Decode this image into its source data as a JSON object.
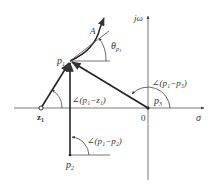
{
  "diagram": {
    "type": "root-locus-angle-condition",
    "axes": {
      "real_axis_label": "σ",
      "imag_axis_label": "jω",
      "origin_label": "0"
    },
    "points": [
      {
        "id": "p1",
        "label_main": "p",
        "label_sub": "1",
        "kind": "pole"
      },
      {
        "id": "p2",
        "label_main": "p",
        "label_sub": "2",
        "kind": "pole"
      },
      {
        "id": "p3",
        "label_main": "p",
        "label_sub": "3",
        "kind": "pole"
      },
      {
        "id": "z1",
        "label_main": "z",
        "label_sub": "1",
        "kind": "zero"
      }
    ],
    "locus_point_label": "A",
    "departure_angle_label": {
      "main": "θ",
      "sub": "p",
      "subsub": "1"
    },
    "angle_labels": {
      "p1_minus_z1": "∠(p₁−z₁)",
      "p1_minus_p3": "∠(p₁−p₃)",
      "p1_minus_p2": "∠(p₁−p₂)"
    },
    "colors": {
      "line": "#333333",
      "background": "#ffffff"
    }
  }
}
